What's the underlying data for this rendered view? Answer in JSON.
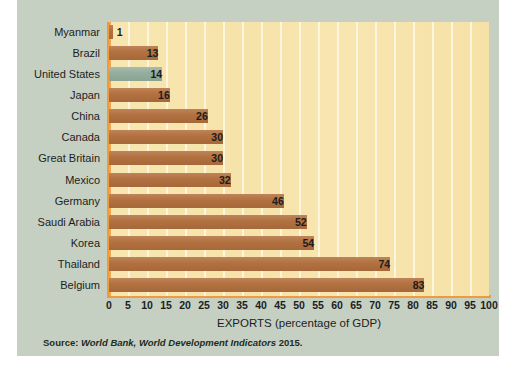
{
  "figure": {
    "source_prefix": "Source:",
    "source_italic_1": "World Bank,",
    "source_italic_2": "World Development Indicators",
    "source_year": "2015."
  },
  "colors": {
    "panel_background": "#c5d0c2",
    "plot_background": "#f7e4ac",
    "gridline": "#fdf6e0",
    "axis_spine": "#ef9a3d",
    "bar": "#b2703f",
    "bar_highlight": "#93ad9c",
    "text": "#1d1d1d"
  },
  "chart_data": {
    "type": "bar",
    "orientation": "horizontal",
    "title": "",
    "xlabel": "EXPORTS (percentage of GDP)",
    "ylabel": "",
    "xlim": [
      0,
      100
    ],
    "xticks": [
      0,
      5,
      10,
      15,
      20,
      25,
      30,
      35,
      40,
      45,
      50,
      55,
      60,
      65,
      70,
      75,
      80,
      85,
      90,
      95,
      100
    ],
    "xtick_labels": [
      "0",
      "5",
      "10",
      "15",
      "20",
      "25",
      "30",
      "35",
      "40",
      "45",
      "50",
      "55",
      "60",
      "65",
      "70",
      "75",
      "80",
      "85",
      "90",
      "95",
      "100"
    ],
    "grid": true,
    "grid_axis": "x",
    "legend": false,
    "categories": [
      "Myanmar",
      "Brazil",
      "United States",
      "Japan",
      "China",
      "Canada",
      "Great Britain",
      "Mexico",
      "Germany",
      "Saudi Arabia",
      "Korea",
      "Thailand",
      "Belgium"
    ],
    "values": [
      1,
      13,
      14,
      16,
      26,
      30,
      30,
      32,
      46,
      52,
      54,
      74,
      83
    ],
    "value_labels": [
      "1",
      "13",
      "14",
      "16",
      "26",
      "30",
      "30",
      "32",
      "46",
      "52",
      "54",
      "74",
      "83"
    ],
    "highlight_category": "United States",
    "bars": [
      {
        "category": "Myanmar",
        "value": 1,
        "label": "1",
        "highlight": false,
        "label_position": "outside"
      },
      {
        "category": "Brazil",
        "value": 13,
        "label": "13",
        "highlight": false,
        "label_position": "inside"
      },
      {
        "category": "United States",
        "value": 14,
        "label": "14",
        "highlight": true,
        "label_position": "inside"
      },
      {
        "category": "Japan",
        "value": 16,
        "label": "16",
        "highlight": false,
        "label_position": "inside"
      },
      {
        "category": "China",
        "value": 26,
        "label": "26",
        "highlight": false,
        "label_position": "inside"
      },
      {
        "category": "Canada",
        "value": 30,
        "label": "30",
        "highlight": false,
        "label_position": "inside"
      },
      {
        "category": "Great Britain",
        "value": 30,
        "label": "30",
        "highlight": false,
        "label_position": "inside"
      },
      {
        "category": "Mexico",
        "value": 32,
        "label": "32",
        "highlight": false,
        "label_position": "inside"
      },
      {
        "category": "Germany",
        "value": 46,
        "label": "46",
        "highlight": false,
        "label_position": "inside"
      },
      {
        "category": "Saudi Arabia",
        "value": 52,
        "label": "52",
        "highlight": false,
        "label_position": "inside"
      },
      {
        "category": "Korea",
        "value": 54,
        "label": "54",
        "highlight": false,
        "label_position": "inside"
      },
      {
        "category": "Thailand",
        "value": 74,
        "label": "74",
        "highlight": false,
        "label_position": "inside"
      },
      {
        "category": "Belgium",
        "value": 83,
        "label": "83",
        "highlight": false,
        "label_position": "inside"
      }
    ]
  }
}
